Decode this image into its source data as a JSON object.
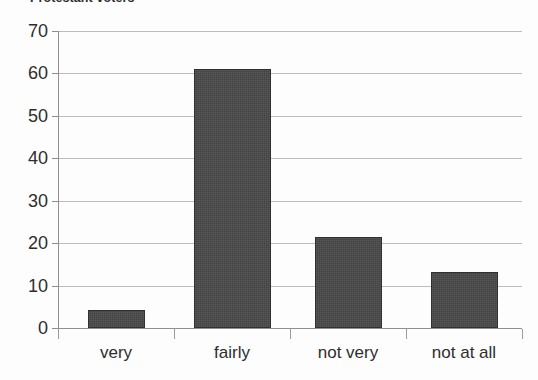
{
  "chart_data": {
    "type": "bar",
    "title": "Protestant voters",
    "categories": [
      "very",
      "fairly",
      "not very",
      "not at all"
    ],
    "values": [
      4.2,
      61,
      21.5,
      13.2
    ],
    "xlabel": "",
    "ylabel": "",
    "ylim": [
      0,
      70
    ],
    "yticks": [
      0,
      10,
      20,
      30,
      40,
      50,
      60,
      70
    ],
    "ytick_labels": [
      "0",
      "10",
      "20",
      "30",
      "40",
      "50",
      "60",
      "70"
    ],
    "grid": true,
    "legend": false,
    "bar_color": "#434343",
    "grid_color": "#bcbcbc",
    "axis_color": "#8f8f8f",
    "text_color": "#2e2e2e"
  }
}
